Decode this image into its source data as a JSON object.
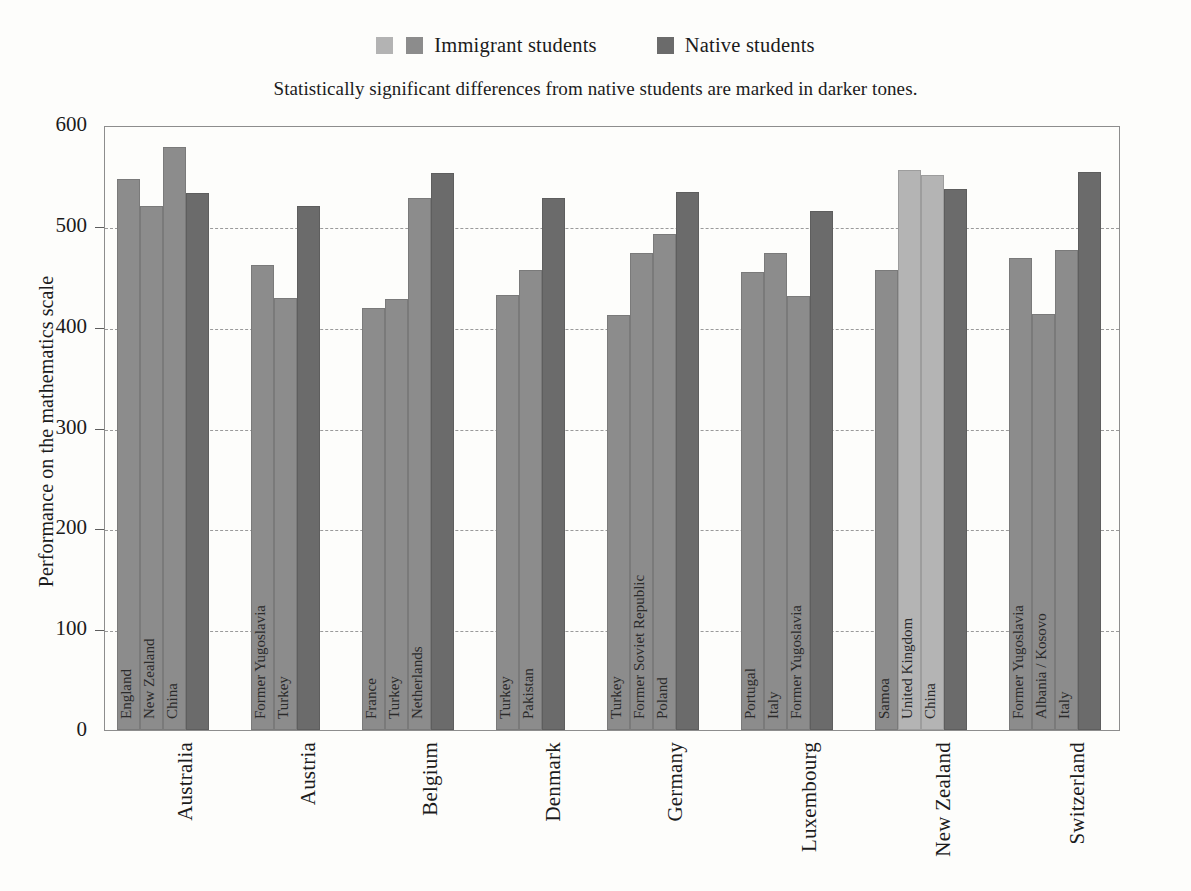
{
  "legend": {
    "immigrant_label": "Immigrant students",
    "native_label": "Native students",
    "swatch_light": "#b4b4b4",
    "swatch_mid": "#8c8c8c",
    "swatch_dark": "#6b6b6b"
  },
  "subtitle": "Statistically significant differences from native students are marked in darker tones.",
  "chart_data": {
    "type": "bar",
    "title": "",
    "subtitle": "Statistically significant differences from native students are marked in darker tones.",
    "xlabel": "",
    "ylabel": "Performance on the mathematics scale",
    "ylim": [
      0,
      600
    ],
    "yticks": [
      0,
      100,
      200,
      300,
      400,
      500,
      600
    ],
    "ytick_labels": [
      "0",
      "100",
      "200",
      "300",
      "400",
      "500",
      "600"
    ],
    "grid": "horizontal-dashed",
    "legend_position": "top-center",
    "legend_entries": [
      "Immigrant students",
      "Native students"
    ],
    "categories": [
      "Australia",
      "Austria",
      "Belgium",
      "Denmark",
      "Germany",
      "Luxembourg",
      "New Zealand",
      "Switzerland"
    ],
    "groups": [
      {
        "country": "Australia",
        "bars": [
          {
            "label": "England",
            "value": 546,
            "tone": "mid"
          },
          {
            "label": "New Zealand",
            "value": 520,
            "tone": "mid"
          },
          {
            "label": "China",
            "value": 578,
            "tone": "mid"
          },
          {
            "label": "Native students",
            "value": 533,
            "tone": "dark"
          }
        ]
      },
      {
        "country": "Austria",
        "bars": [
          {
            "label": "Former Yugoslavia",
            "value": 461,
            "tone": "mid"
          },
          {
            "label": "Turkey",
            "value": 428,
            "tone": "mid"
          },
          {
            "label": "Native students",
            "value": 520,
            "tone": "dark"
          }
        ]
      },
      {
        "country": "Belgium",
        "bars": [
          {
            "label": "France",
            "value": 419,
            "tone": "mid"
          },
          {
            "label": "Turkey",
            "value": 427,
            "tone": "mid"
          },
          {
            "label": "Netherlands",
            "value": 528,
            "tone": "mid"
          },
          {
            "label": "Native students",
            "value": 552,
            "tone": "dark"
          }
        ]
      },
      {
        "country": "Denmark",
        "bars": [
          {
            "label": "Turkey",
            "value": 431,
            "tone": "mid"
          },
          {
            "label": "Pakistan",
            "value": 456,
            "tone": "mid"
          },
          {
            "label": "Native students",
            "value": 528,
            "tone": "dark"
          }
        ]
      },
      {
        "country": "Germany",
        "bars": [
          {
            "label": "Turkey",
            "value": 412,
            "tone": "mid"
          },
          {
            "label": "Former Soviet Republic",
            "value": 473,
            "tone": "mid"
          },
          {
            "label": "Poland",
            "value": 492,
            "tone": "mid"
          },
          {
            "label": "Native students",
            "value": 534,
            "tone": "dark"
          }
        ]
      },
      {
        "country": "Luxembourg",
        "bars": [
          {
            "label": "Portugal",
            "value": 454,
            "tone": "mid"
          },
          {
            "label": "Italy",
            "value": 473,
            "tone": "mid"
          },
          {
            "label": "Former Yugoslavia",
            "value": 430,
            "tone": "mid"
          },
          {
            "label": "Native students",
            "value": 515,
            "tone": "dark"
          }
        ]
      },
      {
        "country": "New Zealand",
        "bars": [
          {
            "label": "Samoa",
            "value": 456,
            "tone": "mid"
          },
          {
            "label": "United Kingdom",
            "value": 555,
            "tone": "light"
          },
          {
            "label": "China",
            "value": 550,
            "tone": "light"
          },
          {
            "label": "Native students",
            "value": 537,
            "tone": "dark"
          }
        ]
      },
      {
        "country": "Switzerland",
        "bars": [
          {
            "label": "Former Yugoslavia",
            "value": 468,
            "tone": "mid"
          },
          {
            "label": "Albania / Kosovo",
            "value": 413,
            "tone": "mid"
          },
          {
            "label": "Italy",
            "value": 476,
            "tone": "mid"
          },
          {
            "label": "Native students",
            "value": 553,
            "tone": "dark"
          }
        ]
      }
    ]
  }
}
